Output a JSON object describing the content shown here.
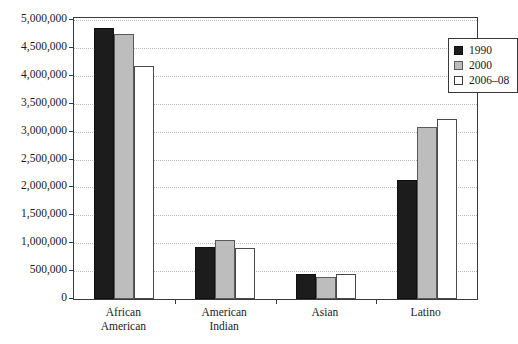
{
  "chart_data": {
    "type": "bar",
    "title": "",
    "subtitle": "",
    "xlabel": "",
    "ylabel": "",
    "categories": [
      "African American",
      "American Indian",
      "Asian",
      "Latino"
    ],
    "category_lines": [
      [
        "African",
        "American"
      ],
      [
        "American",
        "Indian"
      ],
      [
        "Asian"
      ],
      [
        "Latino"
      ]
    ],
    "series": [
      {
        "name": "1990",
        "color": "#1c1c1c",
        "values": [
          4860000,
          925000,
          445000,
          2135000
        ]
      },
      {
        "name": "2000",
        "color": "#bdbdbd",
        "values": [
          4750000,
          1050000,
          390000,
          3090000
        ]
      },
      {
        "name": "2006–08",
        "color": "#ffffff",
        "values": [
          4180000,
          910000,
          440000,
          3235000
        ]
      }
    ],
    "ylim": [
      0,
      5000000
    ],
    "ytick_values": [
      0,
      500000,
      1000000,
      1500000,
      2000000,
      2500000,
      3000000,
      3500000,
      4000000,
      4500000,
      5000000
    ],
    "ytick_labels": [
      "0",
      "500,000",
      "1,000,000",
      "1,500,000",
      "2,000,000",
      "2,500,000",
      "3,000,000",
      "3,500,000",
      "4,000,000",
      "4,500,000",
      "5,000,000"
    ],
    "grid": true,
    "grid_style": "dotted-horizontal",
    "legend_position": "top-right-inside"
  },
  "legend": {
    "entries": [
      {
        "label": "1990"
      },
      {
        "label": "2000"
      },
      {
        "label": "2006–08"
      }
    ]
  },
  "caption": {
    "text": ""
  }
}
